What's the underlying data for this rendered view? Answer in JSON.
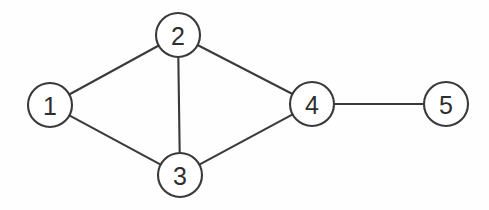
{
  "figure": {
    "kind": "undirected-graph-diagram",
    "title": "",
    "background_color": "#fefefe",
    "stroke_color": "#3a3a3a",
    "label_color": "#2e2e2e",
    "node_fill_color": "#ffffff",
    "node_radius": 22,
    "edge_width": 2.1,
    "width": 489,
    "height": 210
  },
  "graph": {
    "node_count": 5,
    "edge_count": 6,
    "nodes": [
      {
        "id": "1",
        "label": "1",
        "cx": 50,
        "cy": 105,
        "r": 22,
        "degree": 2
      },
      {
        "id": "2",
        "label": "2",
        "cx": 178,
        "cy": 35,
        "r": 22,
        "degree": 3
      },
      {
        "id": "3",
        "label": "3",
        "cx": 180,
        "cy": 175,
        "r": 22,
        "degree": 3
      },
      {
        "id": "4",
        "label": "4",
        "cx": 312,
        "cy": 104,
        "r": 22,
        "degree": 3
      },
      {
        "id": "5",
        "label": "5",
        "cx": 446,
        "cy": 104,
        "r": 22,
        "degree": 1
      }
    ],
    "edges": [
      {
        "id": "edge-1-2",
        "source": "1",
        "target": "2"
      },
      {
        "id": "edge-1-3",
        "source": "1",
        "target": "3"
      },
      {
        "id": "edge-2-3",
        "source": "2",
        "target": "3"
      },
      {
        "id": "edge-2-4",
        "source": "2",
        "target": "4"
      },
      {
        "id": "edge-3-4",
        "source": "3",
        "target": "4"
      },
      {
        "id": "edge-4-5",
        "source": "4",
        "target": "5"
      }
    ]
  }
}
